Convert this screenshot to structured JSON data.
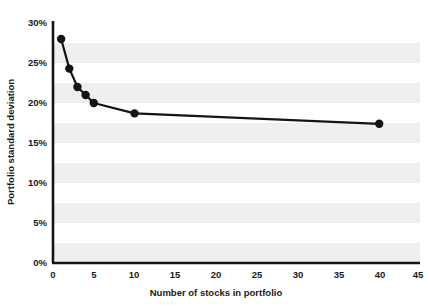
{
  "chart_data": {
    "type": "line",
    "title": "",
    "subtitle": "",
    "xlabel": "Number of stocks in portfolio",
    "ylabel": "Portfolio standard deviation",
    "xlim": [
      0,
      45
    ],
    "ylim": [
      0,
      30
    ],
    "grid": false,
    "banded_background": true,
    "legend": null,
    "xticks": [
      "0",
      "5",
      "10",
      "15",
      "20",
      "25",
      "30",
      "35",
      "40",
      "45"
    ],
    "xtick_values": [
      0,
      5,
      10,
      15,
      20,
      25,
      30,
      35,
      40,
      45
    ],
    "yticks": [
      "0%",
      "5%",
      "10%",
      "15%",
      "20%",
      "25%",
      "30%"
    ],
    "ytick_values": [
      0,
      5,
      10,
      15,
      20,
      25,
      30
    ],
    "series": [
      {
        "name": "Portfolio standard deviation",
        "marker": "filled-circle",
        "color": "#141414",
        "x": [
          1,
          2,
          3,
          4,
          5,
          10,
          40
        ],
        "values": [
          28.0,
          24.3,
          22.0,
          21.0,
          20.0,
          18.7,
          17.4
        ]
      }
    ],
    "annotations": []
  },
  "colors": {
    "line": "#141414",
    "marker": "#141414",
    "axis": "#141414",
    "band": "#efefef",
    "background": "#ffffff",
    "text": "#1a1a1a"
  },
  "axis": {
    "x_title": "Number of stocks in portfolio",
    "y_title": "Portfolio standard deviation"
  },
  "ticks": {
    "x": [
      {
        "label": "0"
      },
      {
        "label": "5"
      },
      {
        "label": "10"
      },
      {
        "label": "15"
      },
      {
        "label": "20"
      },
      {
        "label": "25"
      },
      {
        "label": "30"
      },
      {
        "label": "35"
      },
      {
        "label": "40"
      },
      {
        "label": "45"
      }
    ],
    "y": [
      {
        "label": "0%"
      },
      {
        "label": "5%"
      },
      {
        "label": "10%"
      },
      {
        "label": "15%"
      },
      {
        "label": "20%"
      },
      {
        "label": "25%"
      },
      {
        "label": "30%"
      }
    ]
  }
}
